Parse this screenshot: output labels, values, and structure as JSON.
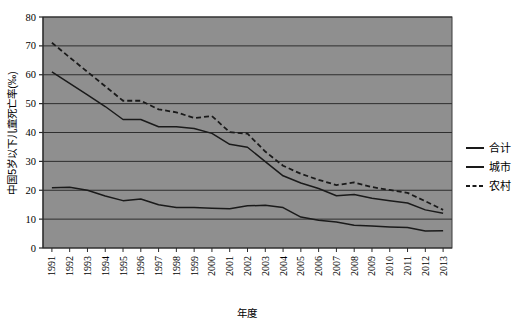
{
  "chart_data": {
    "type": "line",
    "title": "",
    "xlabel": "年度",
    "ylabel": "中国5岁以下儿童死亡率(‰)",
    "ylim": [
      0,
      80
    ],
    "ytick_step": 10,
    "yticks": [
      0,
      10,
      20,
      30,
      40,
      50,
      60,
      70,
      80
    ],
    "grid": true,
    "legend_position": "right",
    "plot_background": "#8f8f8f",
    "line_color": "#1a1a1a",
    "categories": [
      "1991",
      "1992",
      "1993",
      "1994",
      "1995",
      "1996",
      "1997",
      "1998",
      "1999",
      "2000",
      "2001",
      "2002",
      "2003",
      "2004",
      "2005",
      "2006",
      "2007",
      "2008",
      "2009",
      "2010",
      "2011",
      "2012",
      "2013"
    ],
    "series": [
      {
        "name": "合计",
        "style": "solid",
        "values": [
          61.0,
          57.0,
          53.0,
          49.0,
          44.5,
          44.5,
          42.0,
          42.0,
          41.4,
          39.7,
          35.9,
          34.9,
          29.9,
          25.0,
          22.5,
          20.6,
          18.1,
          18.5,
          17.2,
          16.4,
          15.6,
          13.2,
          12.0
        ]
      },
      {
        "name": "城市",
        "style": "solid",
        "values": [
          20.9,
          21.0,
          20.0,
          18.0,
          16.4,
          17.0,
          15.0,
          14.0,
          14.0,
          13.8,
          13.6,
          14.6,
          14.8,
          14.0,
          10.7,
          9.6,
          9.0,
          7.9,
          7.6,
          7.3,
          7.1,
          5.9,
          6.0
        ]
      },
      {
        "name": "农村",
        "style": "dashed",
        "values": [
          71.1,
          66.0,
          61.0,
          56.0,
          51.0,
          51.0,
          48.0,
          47.0,
          45.0,
          45.7,
          40.1,
          39.6,
          33.4,
          28.5,
          25.7,
          23.6,
          21.8,
          22.7,
          21.1,
          20.1,
          19.1,
          16.2,
          13.2
        ]
      }
    ]
  },
  "legend": {
    "items": [
      {
        "label": "合计",
        "style": "solid"
      },
      {
        "label": "城市",
        "style": "solid"
      },
      {
        "label": "农村",
        "style": "dashed"
      }
    ]
  }
}
